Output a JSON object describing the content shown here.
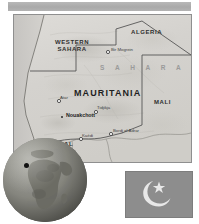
{
  "plate": {
    "title": "Mauritania country plate",
    "banner_color": "#b0b0b0",
    "background_color": "#ffffff"
  },
  "map": {
    "name": "Mauritania reference map",
    "land_color": "#d7d5d2",
    "border_color": "#5c5c5c",
    "countries": [
      {
        "label": "WESTERN SAHARA",
        "line1": "WESTERN",
        "line2": "SAHARA",
        "x": 41,
        "y": 27
      },
      {
        "label": "ALGERIA",
        "x": 117,
        "y": 14
      },
      {
        "label": "MAURITANIA",
        "x": 62,
        "y": 76
      },
      {
        "label": "MALI",
        "x": 140,
        "y": 84
      },
      {
        "label": "SENEGAL",
        "x": 28,
        "y": 128
      }
    ],
    "regions": [
      {
        "label": "S A H A R A",
        "x": 86,
        "y": 50
      }
    ],
    "cities": [
      {
        "label": "Bir Mogrein",
        "x": 97,
        "y": 34,
        "capital": false
      },
      {
        "label": "Atar",
        "x": 47,
        "y": 83,
        "capital": false
      },
      {
        "label": "Nouakchott",
        "x": 52,
        "y": 100,
        "capital": true
      },
      {
        "label": "Tidjikja",
        "x": 84,
        "y": 93,
        "capital": false
      },
      {
        "label": "Bordj el Adrar",
        "x": 99,
        "y": 116,
        "capital": false
      },
      {
        "label": "Kaédi",
        "x": 69,
        "y": 121,
        "capital": false
      }
    ]
  },
  "globe": {
    "name": "Globe locator inset",
    "ocean_color": "#8a8a86",
    "land_color": "#6f6f69",
    "locator_label": "Mauritania location marker",
    "locator_color": "#121212"
  },
  "flag": {
    "name": "Flag of Mauritania",
    "field_color": "#8d8d8d",
    "emblem_color": "#e8e8e8",
    "emblem": "crescent-and-star"
  }
}
